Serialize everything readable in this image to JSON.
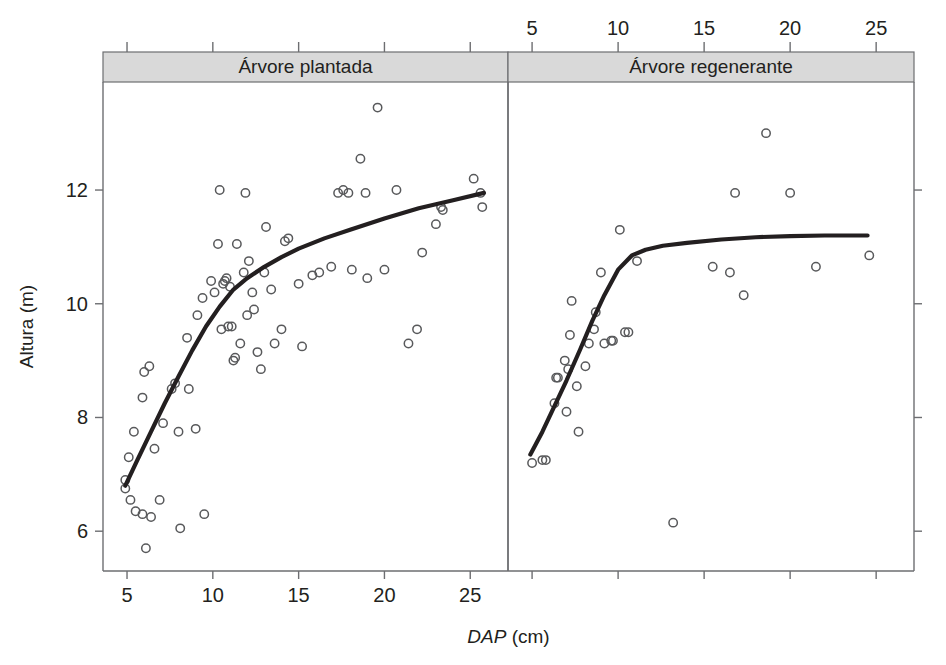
{
  "figure": {
    "title": "",
    "y_axis_label": "Altura (m)",
    "x_axis_label_italic": "DAP",
    "x_axis_label_rest": " (cm)"
  },
  "chart_data": {
    "type": "scatter",
    "title": "",
    "xlabel": "DAP (cm)",
    "ylabel": "Altura (m)",
    "xlim": [
      3.6,
      27.2
    ],
    "ylim": [
      5.3,
      13.9
    ],
    "xticks": [
      5,
      10,
      15,
      20,
      25
    ],
    "yticks": [
      6,
      8,
      10,
      12
    ],
    "xtick_labels": [
      "5",
      "10",
      "15",
      "20",
      "25"
    ],
    "ytick_labels": [
      "6",
      "8",
      "10",
      "12"
    ],
    "grid": false,
    "legend": "none",
    "panel_layout": "1x2 facet, shared y-axis",
    "bottom_axis_labels_panel": "left",
    "top_axis_labels_panel": "right",
    "panels": [
      {
        "name": "planted-tree-panel",
        "strip_label": "Árvore plantada",
        "points": [
          {
            "x": 4.9,
            "y": 6.9
          },
          {
            "x": 4.9,
            "y": 6.75
          },
          {
            "x": 5.1,
            "y": 7.3
          },
          {
            "x": 5.2,
            "y": 6.55
          },
          {
            "x": 5.4,
            "y": 7.75
          },
          {
            "x": 5.5,
            "y": 6.35
          },
          {
            "x": 5.9,
            "y": 8.35
          },
          {
            "x": 5.9,
            "y": 6.3
          },
          {
            "x": 6.0,
            "y": 8.8
          },
          {
            "x": 6.1,
            "y": 5.7
          },
          {
            "x": 6.3,
            "y": 8.9
          },
          {
            "x": 6.4,
            "y": 6.25
          },
          {
            "x": 6.6,
            "y": 7.45
          },
          {
            "x": 6.9,
            "y": 6.55
          },
          {
            "x": 7.1,
            "y": 7.9
          },
          {
            "x": 7.6,
            "y": 8.5
          },
          {
            "x": 7.8,
            "y": 8.6
          },
          {
            "x": 8.0,
            "y": 7.75
          },
          {
            "x": 8.1,
            "y": 6.05
          },
          {
            "x": 8.5,
            "y": 9.4
          },
          {
            "x": 8.6,
            "y": 8.5
          },
          {
            "x": 9.0,
            "y": 7.8
          },
          {
            "x": 9.1,
            "y": 9.8
          },
          {
            "x": 9.4,
            "y": 10.1
          },
          {
            "x": 9.5,
            "y": 6.3
          },
          {
            "x": 9.9,
            "y": 10.4
          },
          {
            "x": 10.1,
            "y": 10.2
          },
          {
            "x": 10.3,
            "y": 11.05
          },
          {
            "x": 10.4,
            "y": 12.0
          },
          {
            "x": 10.5,
            "y": 9.55
          },
          {
            "x": 10.6,
            "y": 10.35
          },
          {
            "x": 10.7,
            "y": 10.4
          },
          {
            "x": 10.8,
            "y": 10.45
          },
          {
            "x": 10.9,
            "y": 9.6
          },
          {
            "x": 11.0,
            "y": 10.3
          },
          {
            "x": 11.1,
            "y": 9.6
          },
          {
            "x": 11.2,
            "y": 9.0
          },
          {
            "x": 11.3,
            "y": 9.05
          },
          {
            "x": 11.4,
            "y": 11.05
          },
          {
            "x": 11.6,
            "y": 9.3
          },
          {
            "x": 11.8,
            "y": 10.55
          },
          {
            "x": 11.9,
            "y": 11.95
          },
          {
            "x": 12.0,
            "y": 9.8
          },
          {
            "x": 12.1,
            "y": 10.75
          },
          {
            "x": 12.3,
            "y": 10.2
          },
          {
            "x": 12.4,
            "y": 9.9
          },
          {
            "x": 12.6,
            "y": 9.15
          },
          {
            "x": 12.8,
            "y": 8.85
          },
          {
            "x": 13.0,
            "y": 10.55
          },
          {
            "x": 13.1,
            "y": 11.35
          },
          {
            "x": 13.4,
            "y": 10.25
          },
          {
            "x": 13.6,
            "y": 9.3
          },
          {
            "x": 14.0,
            "y": 9.55
          },
          {
            "x": 14.2,
            "y": 11.1
          },
          {
            "x": 14.4,
            "y": 11.15
          },
          {
            "x": 15.0,
            "y": 10.35
          },
          {
            "x": 15.2,
            "y": 9.25
          },
          {
            "x": 15.8,
            "y": 10.5
          },
          {
            "x": 16.2,
            "y": 10.55
          },
          {
            "x": 16.9,
            "y": 10.65
          },
          {
            "x": 17.3,
            "y": 11.95
          },
          {
            "x": 17.6,
            "y": 12.0
          },
          {
            "x": 17.9,
            "y": 11.95
          },
          {
            "x": 18.1,
            "y": 10.6
          },
          {
            "x": 18.6,
            "y": 12.55
          },
          {
            "x": 18.9,
            "y": 11.95
          },
          {
            "x": 19.0,
            "y": 10.45
          },
          {
            "x": 19.6,
            "y": 13.45
          },
          {
            "x": 20.0,
            "y": 10.6
          },
          {
            "x": 20.7,
            "y": 12.0
          },
          {
            "x": 21.4,
            "y": 9.3
          },
          {
            "x": 21.9,
            "y": 9.55
          },
          {
            "x": 22.2,
            "y": 10.9
          },
          {
            "x": 23.0,
            "y": 11.4
          },
          {
            "x": 23.3,
            "y": 11.7
          },
          {
            "x": 23.4,
            "y": 11.65
          },
          {
            "x": 25.2,
            "y": 12.2
          },
          {
            "x": 25.6,
            "y": 11.95
          },
          {
            "x": 25.7,
            "y": 11.7
          }
        ],
        "fit_line": [
          {
            "x": 4.9,
            "y": 6.8
          },
          {
            "x": 5.6,
            "y": 7.25
          },
          {
            "x": 6.4,
            "y": 7.75
          },
          {
            "x": 7.2,
            "y": 8.25
          },
          {
            "x": 8.0,
            "y": 8.72
          },
          {
            "x": 8.8,
            "y": 9.18
          },
          {
            "x": 9.6,
            "y": 9.6
          },
          {
            "x": 10.4,
            "y": 9.95
          },
          {
            "x": 11.2,
            "y": 10.25
          },
          {
            "x": 12.0,
            "y": 10.45
          },
          {
            "x": 13.0,
            "y": 10.65
          },
          {
            "x": 14.0,
            "y": 10.82
          },
          {
            "x": 15.0,
            "y": 10.97
          },
          {
            "x": 16.5,
            "y": 11.15
          },
          {
            "x": 18.0,
            "y": 11.3
          },
          {
            "x": 20.0,
            "y": 11.5
          },
          {
            "x": 22.0,
            "y": 11.68
          },
          {
            "x": 24.0,
            "y": 11.82
          },
          {
            "x": 25.8,
            "y": 11.95
          }
        ]
      },
      {
        "name": "regenerating-tree-panel",
        "strip_label": "Árvore regenerante",
        "points": [
          {
            "x": 5.0,
            "y": 7.2
          },
          {
            "x": 5.6,
            "y": 7.25
          },
          {
            "x": 5.8,
            "y": 7.25
          },
          {
            "x": 6.3,
            "y": 8.25
          },
          {
            "x": 6.4,
            "y": 8.7
          },
          {
            "x": 6.5,
            "y": 8.7
          },
          {
            "x": 6.9,
            "y": 9.0
          },
          {
            "x": 7.0,
            "y": 8.1
          },
          {
            "x": 7.1,
            "y": 8.85
          },
          {
            "x": 7.2,
            "y": 9.45
          },
          {
            "x": 7.3,
            "y": 10.05
          },
          {
            "x": 7.6,
            "y": 8.55
          },
          {
            "x": 7.7,
            "y": 7.75
          },
          {
            "x": 8.1,
            "y": 8.9
          },
          {
            "x": 8.3,
            "y": 9.3
          },
          {
            "x": 8.6,
            "y": 9.55
          },
          {
            "x": 8.7,
            "y": 9.85
          },
          {
            "x": 9.0,
            "y": 10.55
          },
          {
            "x": 9.2,
            "y": 9.3
          },
          {
            "x": 9.6,
            "y": 9.35
          },
          {
            "x": 9.7,
            "y": 9.35
          },
          {
            "x": 10.1,
            "y": 11.3
          },
          {
            "x": 10.4,
            "y": 9.5
          },
          {
            "x": 10.6,
            "y": 9.5
          },
          {
            "x": 11.1,
            "y": 10.75
          },
          {
            "x": 13.2,
            "y": 6.15
          },
          {
            "x": 15.5,
            "y": 10.65
          },
          {
            "x": 16.5,
            "y": 10.55
          },
          {
            "x": 16.8,
            "y": 11.95
          },
          {
            "x": 17.3,
            "y": 10.15
          },
          {
            "x": 18.6,
            "y": 13.0
          },
          {
            "x": 20.0,
            "y": 11.95
          },
          {
            "x": 21.5,
            "y": 10.65
          },
          {
            "x": 24.6,
            "y": 10.85
          }
        ],
        "fit_line": [
          {
            "x": 4.9,
            "y": 7.35
          },
          {
            "x": 5.6,
            "y": 7.75
          },
          {
            "x": 6.3,
            "y": 8.2
          },
          {
            "x": 7.0,
            "y": 8.65
          },
          {
            "x": 7.8,
            "y": 9.2
          },
          {
            "x": 8.5,
            "y": 9.7
          },
          {
            "x": 9.2,
            "y": 10.15
          },
          {
            "x": 10.0,
            "y": 10.6
          },
          {
            "x": 10.8,
            "y": 10.85
          },
          {
            "x": 11.6,
            "y": 10.95
          },
          {
            "x": 12.6,
            "y": 11.02
          },
          {
            "x": 14.0,
            "y": 11.07
          },
          {
            "x": 16.0,
            "y": 11.13
          },
          {
            "x": 18.0,
            "y": 11.17
          },
          {
            "x": 20.0,
            "y": 11.19
          },
          {
            "x": 22.0,
            "y": 11.2
          },
          {
            "x": 24.5,
            "y": 11.2
          }
        ]
      }
    ]
  }
}
